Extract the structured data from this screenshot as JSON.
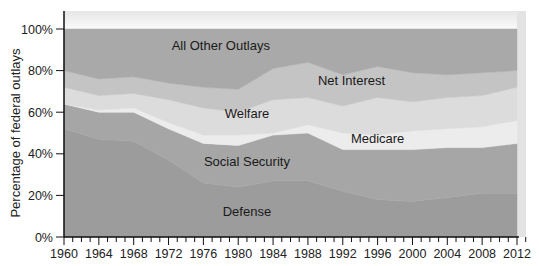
{
  "chart_data": {
    "type": "area",
    "stacked": true,
    "title": "",
    "xlabel": "",
    "ylabel": "Percentage of federal outlays",
    "ylim": [
      0,
      100
    ],
    "xlim": [
      1960,
      2012
    ],
    "y_ticks": [
      "0%",
      "20%",
      "40%",
      "60%",
      "80%",
      "100%"
    ],
    "x_ticks": [
      "1960",
      "1964",
      "1968",
      "1972",
      "1976",
      "1980",
      "1984",
      "1988",
      "1992",
      "1996",
      "2000",
      "2004",
      "2008",
      "2012"
    ],
    "grid": false,
    "legend": "inline labels",
    "x": [
      1960,
      1964,
      1968,
      1972,
      1976,
      1980,
      1984,
      1988,
      1992,
      1996,
      2000,
      2004,
      2008,
      2012
    ],
    "series": [
      {
        "name": "Defense",
        "color": "#9c9c9c",
        "values": [
          52,
          47,
          46,
          37,
          26,
          24,
          27,
          27,
          22,
          18,
          17,
          19,
          21,
          21
        ]
      },
      {
        "name": "Social Security",
        "color": "#a6a6a6",
        "values": [
          12,
          13,
          14,
          15,
          19,
          20,
          22,
          23,
          20,
          24,
          25,
          24,
          22,
          24
        ]
      },
      {
        "name": "Medicare",
        "color": "#ececec",
        "values": [
          0,
          1,
          2,
          3,
          4,
          5,
          1,
          4,
          8,
          7,
          9,
          9,
          10,
          11
        ]
      },
      {
        "name": "Welfare",
        "color": "#dcdcdc",
        "values": [
          8,
          7,
          7,
          11,
          13,
          11,
          16,
          13,
          13,
          18,
          14,
          15,
          15,
          16
        ]
      },
      {
        "name": "Net Interest",
        "color": "#c4c4c4",
        "values": [
          8,
          8,
          8,
          8,
          10,
          11,
          15,
          17,
          15,
          15,
          14,
          11,
          11,
          8
        ]
      },
      {
        "name": "All Other Outlays",
        "color": "#a9a9a9",
        "values": [
          20,
          24,
          23,
          26,
          28,
          29,
          19,
          16,
          22,
          18,
          21,
          22,
          21,
          20
        ]
      }
    ],
    "annotations": [
      {
        "text": "All Other Outlays",
        "x": 1978,
        "y": 92
      },
      {
        "text": "Net Interest",
        "x": 1993,
        "y": 75
      },
      {
        "text": "Welfare",
        "x": 1981,
        "y": 59
      },
      {
        "text": "Medicare",
        "x": 1996,
        "y": 47
      },
      {
        "text": "Social Security",
        "x": 1981,
        "y": 36
      },
      {
        "text": "Defense",
        "x": 1981,
        "y": 12
      }
    ]
  },
  "axis": {
    "ylabel": "Percentage of federal outlays"
  }
}
